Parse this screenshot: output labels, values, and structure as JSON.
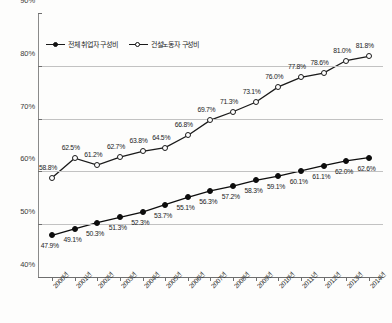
{
  "chart_data": {
    "type": "line",
    "title": "",
    "xlabel": "",
    "ylabel": "",
    "ylim": [
      40,
      90
    ],
    "ytick_values": [
      40,
      50,
      60,
      70,
      80,
      90
    ],
    "ytick_labels": [
      "40%",
      "50%",
      "60%",
      "70%",
      "80%",
      "90%"
    ],
    "grid": true,
    "legend_position": "top-left",
    "categories": [
      "2000년",
      "2001년",
      "2002년",
      "2003년",
      "2004년",
      "2005년",
      "2006년",
      "2007년",
      "2008년",
      "2009년",
      "2010년",
      "2011년",
      "2012년",
      "2013년",
      "2014년"
    ],
    "series": [
      {
        "name": "전체 취업자 구성비",
        "marker": "filled-circle",
        "color": "#0d0d0d",
        "values": [
          47.9,
          49.1,
          50.3,
          51.3,
          52.3,
          53.7,
          55.1,
          56.3,
          57.2,
          58.3,
          59.1,
          60.1,
          61.1,
          62.0,
          62.6
        ],
        "labels": [
          "47.9%",
          "49.1%",
          "50.3%",
          "51.3%",
          "52.3%",
          "53.7%",
          "55.1%",
          "56.3%",
          "57.2%",
          "58.3%",
          "59.1%",
          "60.1%",
          "61.1%",
          "62.0%",
          "62.6%"
        ]
      },
      {
        "name": "건설노동자 구성비",
        "marker": "hollow-circle",
        "color": "#1a1a1a",
        "values": [
          58.8,
          62.5,
          61.2,
          62.7,
          63.8,
          64.5,
          66.8,
          69.7,
          71.3,
          73.1,
          76.0,
          77.8,
          78.6,
          81.0,
          81.8
        ],
        "labels": [
          "58.8%",
          "62.5%",
          "61.2%",
          "62.7%",
          "63.8%",
          "64.5%",
          "66.8%",
          "69.7%",
          "71.3%",
          "73.1%",
          "76.0%",
          "77.8%",
          "78.6%",
          "81.0%",
          "81.8%"
        ]
      }
    ]
  }
}
